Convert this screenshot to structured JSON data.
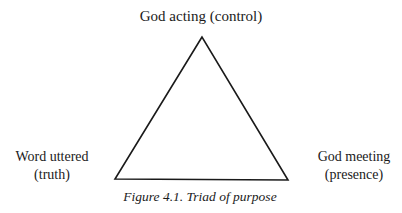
{
  "diagram": {
    "type": "triangle",
    "vertices": {
      "top": {
        "line1": "God acting (control)"
      },
      "bottom_left": {
        "line1": "Word uttered",
        "line2": "(truth)"
      },
      "bottom_right": {
        "line1": "God meeting",
        "line2": "(presence)"
      }
    },
    "caption": "Figure 4.1. Triad of purpose",
    "stroke_color": "#1a1a1a"
  }
}
